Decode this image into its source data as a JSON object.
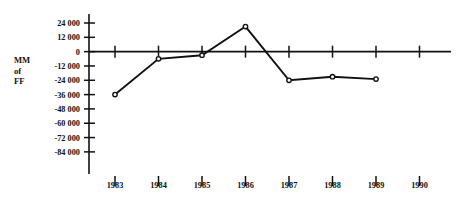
{
  "chart_data": {
    "type": "line",
    "title": "",
    "subtitle": "",
    "xlabel": "",
    "ylabel": "MM of FF",
    "ylabel_lines": [
      "MM",
      "of",
      "FF"
    ],
    "categories": [
      "1983",
      "1984",
      "1985",
      "1986",
      "1987",
      "1988",
      "1989",
      "1990"
    ],
    "x": [
      1983,
      1984,
      1985,
      1986,
      1987,
      1988,
      1989,
      1990
    ],
    "values": [
      -36000,
      -6000,
      -3000,
      21000,
      -24000,
      -21000,
      -23000,
      null
    ],
    "series": [
      {
        "name": "",
        "values": [
          -36000,
          -6000,
          -3000,
          21000,
          -24000,
          -21000,
          -23000,
          null
        ]
      }
    ],
    "ylim": [
      -84000,
      24000
    ],
    "ytick_step": 12000,
    "ytick_values": [
      24000,
      12000,
      0,
      -12000,
      -24000,
      -36000,
      -48000,
      -60000,
      -72000,
      -84000
    ],
    "ytick_labels": [
      "24 000",
      "12 000",
      "0",
      "-12 000",
      "-24 000",
      "-36 000",
      "-48 000",
      "-60 000",
      "-72 000",
      "-84 000"
    ],
    "xtick_labels": [
      "1983",
      "1984",
      "1985",
      "1986",
      "1987",
      "1988",
      "1989",
      "1990"
    ],
    "grid": false,
    "legend": false,
    "legend_position": "none",
    "marker": "open-circle",
    "line_color": "#111111",
    "marker_fill": "#111111",
    "background_color": "#ffffff",
    "zero_line": true,
    "annotations": []
  }
}
